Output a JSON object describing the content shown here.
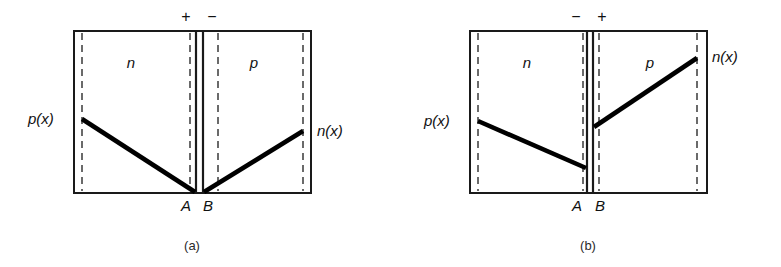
{
  "figure": {
    "type": "semiconductor-pn-junction-carrier-distribution",
    "background": "#ffffff",
    "ink_color": "#111111",
    "panels": [
      {
        "id": "a",
        "caption": "(a)",
        "bias": "forward",
        "polarity_left": "+",
        "polarity_right": "−",
        "region_left_label": "n",
        "region_right_label": "p",
        "left_curve_label": "p(x)",
        "right_curve_label": "n(x)",
        "junction_left_label": "A",
        "junction_right_label": "B",
        "box": {
          "x": 74,
          "y": 31,
          "width": 237,
          "height": 162
        },
        "dashed_verticals": [
          82,
          190,
          218,
          303
        ],
        "junction_verticals": [
          196,
          203
        ],
        "left_curve": {
          "x1": 82,
          "y1": 119,
          "x2": 195,
          "y2": 192
        },
        "right_curve": {
          "x1": 204,
          "y1": 192,
          "x2": 303,
          "y2": 131
        },
        "sign_left_pos": {
          "x": 186,
          "y": 22
        },
        "sign_right_pos": {
          "x": 212,
          "y": 22
        },
        "left_label_pos": {
          "x": 28,
          "y": 124
        },
        "right_label_pos": {
          "x": 317,
          "y": 136
        },
        "region_left_pos": {
          "x": 131,
          "y": 68
        },
        "region_right_pos": {
          "x": 254,
          "y": 68
        },
        "point_a_pos": {
          "x": 186,
          "y": 211
        },
        "point_b_pos": {
          "x": 208,
          "y": 211
        },
        "caption_pos": {
          "x": 192,
          "y": 250
        }
      },
      {
        "id": "b",
        "caption": "(b)",
        "bias": "reverse",
        "polarity_left": "−",
        "polarity_right": "+",
        "region_left_label": "n",
        "region_right_label": "p",
        "left_curve_label": "p(x)",
        "right_curve_label": "n(x)",
        "junction_left_label": "A",
        "junction_right_label": "B",
        "box": {
          "x": 470,
          "y": 31,
          "width": 237,
          "height": 162
        },
        "dashed_verticals": [
          478,
          583,
          592,
          697
        ],
        "junction_verticals": [
          587,
          593
        ],
        "left_curve": {
          "x1": 478,
          "y1": 121,
          "x2": 586,
          "y2": 168
        },
        "right_curve": {
          "x1": 594,
          "y1": 127,
          "x2": 697,
          "y2": 58
        },
        "sign_left_pos": {
          "x": 576,
          "y": 22
        },
        "sign_right_pos": {
          "x": 602,
          "y": 22
        },
        "left_label_pos": {
          "x": 424,
          "y": 126
        },
        "right_label_pos": {
          "x": 712,
          "y": 62
        },
        "region_left_pos": {
          "x": 527,
          "y": 68
        },
        "region_right_pos": {
          "x": 650,
          "y": 68
        },
        "point_a_pos": {
          "x": 577,
          "y": 211
        },
        "point_b_pos": {
          "x": 600,
          "y": 211
        },
        "caption_pos": {
          "x": 588,
          "y": 250
        }
      }
    ]
  }
}
